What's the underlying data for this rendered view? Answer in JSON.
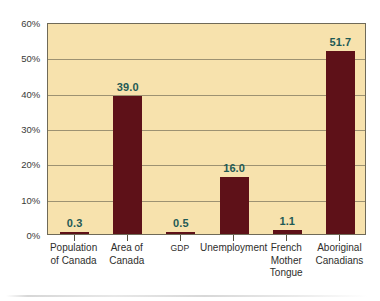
{
  "chart_data": {
    "type": "bar",
    "title": "",
    "subtitle": "",
    "xlabel": "",
    "ylabel": "",
    "categories": [
      "Population\nof Canada",
      "Area of\nCanada",
      "GDP",
      "Unemployment",
      "French\nMother\nTongue",
      "Aboriginal\nCanadians"
    ],
    "values": [
      0.3,
      39.0,
      0.5,
      16.0,
      1.1,
      51.7
    ],
    "value_labels": [
      "0.3",
      "39.0",
      "0.5",
      "16.0",
      "1.1",
      "51.7"
    ],
    "ylim": [
      0,
      60
    ],
    "ytick_values": [
      0,
      10,
      20,
      30,
      40,
      50,
      60
    ],
    "ytick_labels": [
      "0%",
      "10%",
      "20%",
      "30%",
      "40%",
      "50%",
      "60%"
    ],
    "grid": true,
    "grid_axis": "y",
    "legend": false,
    "legend_position": "none",
    "colors": {
      "bar": "#5e1118",
      "plot_background": "#f7e2ad",
      "page_background": "#ffffff",
      "gridline": "#8d8467",
      "axis_frame": "#6f6a58",
      "value_label": "#1f5a55",
      "tick_label": "#3a3a38",
      "category_label": "#2e2e2c"
    },
    "bar_label_small_indices": [
      2
    ]
  }
}
